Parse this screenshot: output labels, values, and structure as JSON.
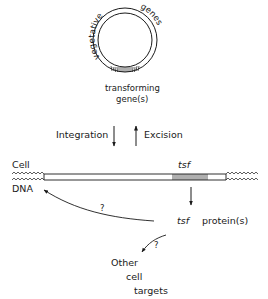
{
  "plasmid": {
    "arc_label_left": "vegetative",
    "arc_label_right": "genes",
    "segment_label_line1": "transforming",
    "segment_label_line2": "gene(s)"
  },
  "transitions": {
    "integration": "Integration",
    "excision": "Excision"
  },
  "chromosome": {
    "label_top": "Cell",
    "label_bottom": "DNA",
    "gene_label": "tsf"
  },
  "product": {
    "gene": "tsf",
    "label": "protein(s)"
  },
  "feedback": {
    "to_dna_question": "?",
    "to_targets_question": "?"
  },
  "targets": {
    "line1": "Other",
    "line2": "cell",
    "line3": "targets"
  },
  "colors": {
    "ink": "#1a1a1a",
    "background": "#ffffff"
  }
}
